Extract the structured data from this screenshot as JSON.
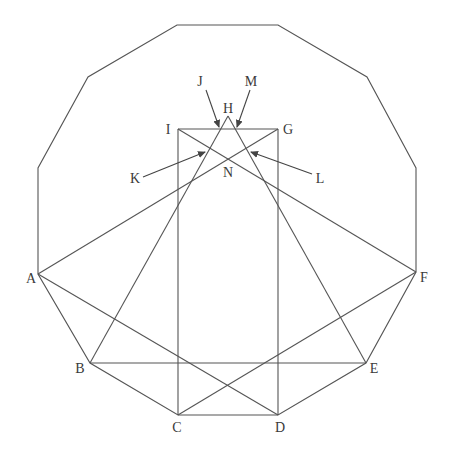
{
  "diagram": {
    "type": "geometric-construction",
    "stroke_color": "#555555",
    "background": "#ffffff",
    "polygon": {
      "name": "dodecagon",
      "vertices": [
        [
          177,
          25
        ],
        [
          278,
          25
        ],
        [
          367,
          77
        ],
        [
          416,
          168
        ],
        [
          416,
          272
        ],
        [
          366,
          363
        ],
        [
          278,
          415
        ],
        [
          178,
          415
        ],
        [
          90,
          363
        ],
        [
          38,
          274
        ],
        [
          38,
          168
        ],
        [
          88,
          77
        ]
      ]
    },
    "points": {
      "A": {
        "label": "A",
        "x": 38,
        "y": 274,
        "lx": 31,
        "ly": 283
      },
      "B": {
        "label": "B",
        "x": 90,
        "y": 363,
        "lx": 80,
        "ly": 373
      },
      "C": {
        "label": "C",
        "x": 178,
        "y": 415,
        "lx": 177,
        "ly": 432
      },
      "D": {
        "label": "D",
        "x": 278,
        "y": 415,
        "lx": 280,
        "ly": 432
      },
      "E": {
        "label": "E",
        "x": 366,
        "y": 363,
        "lx": 374,
        "ly": 373
      },
      "F": {
        "label": "F",
        "x": 416,
        "y": 272,
        "lx": 424,
        "ly": 282
      },
      "G": {
        "label": "G",
        "x": 278,
        "y": 129,
        "lx": 288,
        "ly": 134
      },
      "H": {
        "label": "H",
        "x": 228,
        "y": 116,
        "lx": 228,
        "ly": 113
      },
      "I": {
        "label": "I",
        "x": 178,
        "y": 129,
        "lx": 168,
        "ly": 134
      },
      "J": {
        "label": "J",
        "lx": 200,
        "ly": 86
      },
      "K": {
        "label": "K",
        "lx": 135,
        "ly": 183
      },
      "L": {
        "label": "L",
        "lx": 320,
        "ly": 183
      },
      "M": {
        "label": "M",
        "lx": 251,
        "ly": 86
      },
      "N": {
        "label": "N",
        "x": 228,
        "y": 159,
        "lx": 228,
        "ly": 177
      }
    },
    "segments": [
      [
        "I",
        "G"
      ],
      [
        "I",
        "C"
      ],
      [
        "G",
        "D"
      ],
      [
        "A",
        "G"
      ],
      [
        "A",
        "D"
      ],
      [
        "B",
        "H"
      ],
      [
        "B",
        "E"
      ],
      [
        "E",
        "H"
      ],
      [
        "F",
        "I"
      ],
      [
        "F",
        "C"
      ]
    ],
    "arrows": [
      {
        "label": "J",
        "from": [
          206,
          90
        ],
        "to": [
          219,
          127
        ]
      },
      {
        "label": "M",
        "from": [
          250,
          90
        ],
        "to": [
          237,
          127
        ]
      },
      {
        "label": "K",
        "from": [
          143,
          177
        ],
        "to": [
          205,
          152
        ]
      },
      {
        "label": "L",
        "from": [
          312,
          174
        ],
        "to": [
          251,
          152
        ]
      }
    ]
  }
}
